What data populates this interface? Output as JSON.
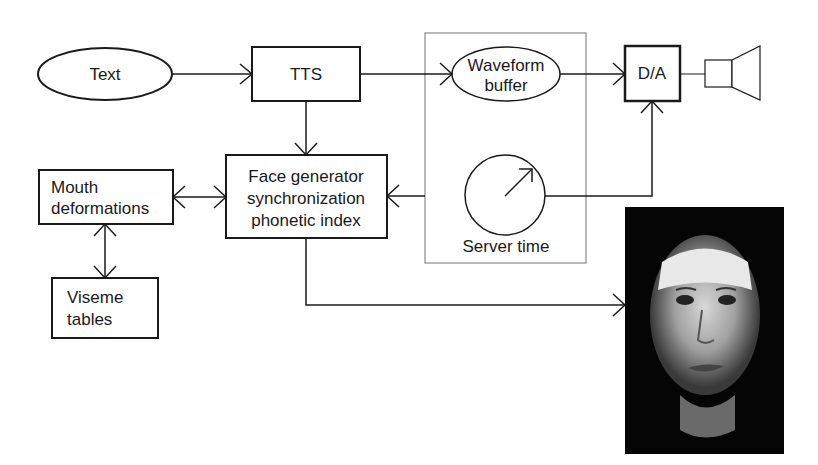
{
  "diagram": {
    "nodes": {
      "text": {
        "label": "Text",
        "shape": "ellipse"
      },
      "tts": {
        "label": "TTS",
        "shape": "box"
      },
      "waveform": {
        "label_line1": "Waveform",
        "label_line2": "buffer",
        "shape": "ellipse"
      },
      "da": {
        "label": "D/A",
        "shape": "box"
      },
      "speaker": {
        "icon": "speaker-icon"
      },
      "face_generator": {
        "label_line1": "Face generator",
        "label_line2": "synchronization",
        "label_line3": "phonetic index",
        "shape": "box"
      },
      "mouth": {
        "label_line1": "Mouth",
        "label_line2": "deformations",
        "shape": "box"
      },
      "viseme": {
        "label_line1": "Viseme",
        "label_line2": "tables",
        "shape": "box"
      },
      "server_time": {
        "label": "Server time",
        "icon": "clock-icon"
      },
      "face_image": {
        "description": "rendered talking face output"
      }
    },
    "edges": [
      {
        "from": "Text",
        "to": "TTS"
      },
      {
        "from": "TTS",
        "to": "Waveform buffer"
      },
      {
        "from": "TTS",
        "to": "Face generator"
      },
      {
        "from": "Waveform buffer",
        "to": "D/A"
      },
      {
        "from": "Server time",
        "to": "D/A"
      },
      {
        "from": "Server time",
        "to": "Face generator"
      },
      {
        "from": "Mouth deformations",
        "to": "Face generator",
        "bidirectional": true
      },
      {
        "from": "Mouth deformations",
        "to": "Viseme tables",
        "bidirectional": true
      },
      {
        "from": "Face generator",
        "to": "Face image"
      },
      {
        "from": "D/A",
        "to": "Speaker"
      }
    ],
    "colors": {
      "stroke": "#1a1a1a",
      "server_box": "#8a8a8a",
      "background": "#ffffff"
    }
  }
}
